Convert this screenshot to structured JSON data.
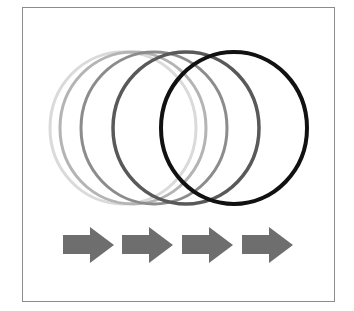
{
  "diagram": {
    "circles": [
      {
        "cx": 123,
        "cy": 128,
        "rx": 73,
        "ry": 76,
        "stroke": "#dadada",
        "width": 3
      },
      {
        "cx": 133,
        "cy": 128,
        "rx": 73,
        "ry": 76,
        "stroke": "#b4b4b4",
        "width": 3
      },
      {
        "cx": 154,
        "cy": 128,
        "rx": 73,
        "ry": 76,
        "stroke": "#8c8c8c",
        "width": 3
      },
      {
        "cx": 186,
        "cy": 128,
        "rx": 73,
        "ry": 76,
        "stroke": "#595959",
        "width": 3.5
      },
      {
        "cx": 234,
        "cy": 128,
        "rx": 73,
        "ry": 76,
        "stroke": "#111111",
        "width": 4
      }
    ],
    "arrows": [
      {
        "x": 63,
        "label": "arrow-1"
      },
      {
        "x": 122,
        "label": "arrow-2"
      },
      {
        "x": 182,
        "label": "arrow-3"
      },
      {
        "x": 242,
        "label": "arrow-4"
      }
    ],
    "arrow_color": "#6e6e6e",
    "frame_color": "#8c8c8c"
  }
}
